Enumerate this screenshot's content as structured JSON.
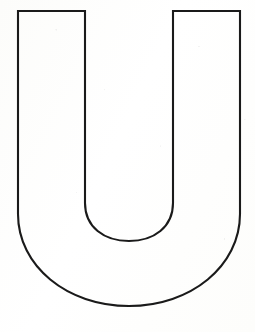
{
  "document": {
    "title": "Letter U Coloring Outline",
    "kind": "coloring-page",
    "subject": "uppercase-letter",
    "letter": "U"
  },
  "canvas": {
    "width": 255,
    "height": 332,
    "background_color": "#fdfdfb",
    "paper_tone": "off-white scanned paper"
  },
  "artwork": {
    "name": "letter-u-outline",
    "description": "Large block capital letter U drawn as a hollow outline, sans-serif style with flat square tops on both vertical arms and a rounded U-shaped bowl at the bottom.",
    "stroke_color": "#1a1a1a",
    "stroke_width": 2.1,
    "fill_color": "#ffffff",
    "fill": "none",
    "geometry": {
      "outer_left_x": 18,
      "outer_right_x": 240,
      "inner_left_x": 85,
      "inner_right_x": 173,
      "top_y": 11,
      "outer_bottom_y": 306,
      "inner_bottom_y": 241,
      "outer_straight_until_y": 214,
      "inner_straight_until_y": 203,
      "arm_stroke_thickness": 67,
      "outer_bowl_radius": 111,
      "inner_bowl_radius": 44
    },
    "path": "M 18 11 L 85 11 L 85 203 C 85 227 104 241 129 241 C 154 241 173 227 173 203 L 173 11 L 240 11 L 240 214 C 240 266 191 306 129 306 C 67 306 18 266 18 214 Z"
  }
}
